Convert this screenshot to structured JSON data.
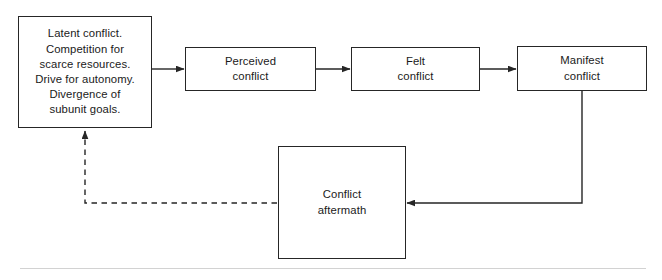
{
  "diagram": {
    "type": "flowchart",
    "background_color": "#ffffff",
    "line_color": "#262626",
    "text_color": "#1a1a1a",
    "nodes": [
      {
        "id": "latent",
        "label": "Latent conflict.\nCompetition for\nscarce resources.\nDrive for autonomy.\nDivergence of\nsubunit goals.",
        "shape": "rectangle"
      },
      {
        "id": "perceived",
        "label": "Perceived\nconflict",
        "shape": "rectangle"
      },
      {
        "id": "felt",
        "label": "Felt\nconflict",
        "shape": "rectangle"
      },
      {
        "id": "manifest",
        "label": "Manifest\nconflict",
        "shape": "rectangle"
      },
      {
        "id": "aftermath",
        "label": "Conflict\naftermath",
        "shape": "rectangle"
      }
    ],
    "edges": [
      {
        "id": "latent-to-perceived",
        "from": "latent",
        "to": "perceived",
        "style": "solid",
        "arrow": "end",
        "label": ""
      },
      {
        "id": "perceived-to-felt",
        "from": "perceived",
        "to": "felt",
        "style": "solid",
        "arrow": "end",
        "label": ""
      },
      {
        "id": "felt-to-manifest",
        "from": "felt",
        "to": "manifest",
        "style": "solid",
        "arrow": "end",
        "label": ""
      },
      {
        "id": "manifest-to-aftermath",
        "from": "manifest",
        "to": "aftermath",
        "style": "solid",
        "arrow": "end",
        "label": ""
      },
      {
        "id": "aftermath-to-latent",
        "from": "aftermath",
        "to": "latent",
        "style": "dashed",
        "arrow": "end",
        "label": ""
      }
    ]
  },
  "footer": {
    "rule_color": "#d2d2d2"
  }
}
